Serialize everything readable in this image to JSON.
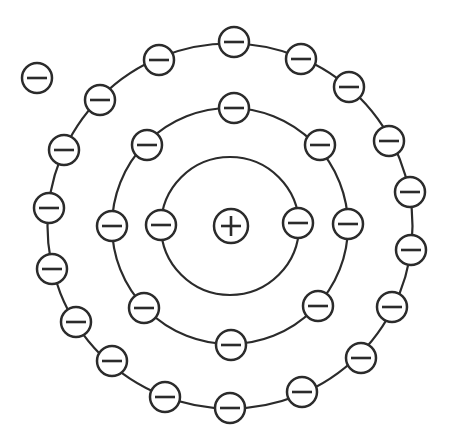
{
  "canvas": {
    "width": 449,
    "height": 436,
    "background": "#ffffff"
  },
  "style": {
    "stroke_color": "#2b2b2b",
    "particle_fill": "#ffffff",
    "orbit_stroke_width": 2.2,
    "particle_stroke_width": 2.5,
    "symbol_stroke_width": 2.6,
    "electron_radius": 15,
    "nucleus_radius": 17,
    "symbol_arm": 10
  },
  "center": {
    "x": 230,
    "y": 226
  },
  "nucleus": {
    "x": 231,
    "y": 226,
    "symbol": "+"
  },
  "electron_symbol": "−",
  "shells": [
    {
      "index": 1,
      "orbit_radius": 69,
      "electron_count": 2,
      "electrons": [
        [
          161,
          225
        ],
        [
          298,
          223
        ]
      ]
    },
    {
      "index": 2,
      "orbit_radius": 118,
      "electron_count": 8,
      "electrons": [
        [
          234,
          108
        ],
        [
          320,
          145
        ],
        [
          348,
          224
        ],
        [
          318,
          306
        ],
        [
          231,
          345
        ],
        [
          144,
          308
        ],
        [
          112,
          226
        ],
        [
          147,
          145
        ]
      ]
    },
    {
      "index": 3,
      "orbit_radius": 182.5,
      "electron_count": 18,
      "electrons": [
        [
          234,
          42
        ],
        [
          301,
          59
        ],
        [
          349,
          87
        ],
        [
          389,
          141
        ],
        [
          410,
          192
        ],
        [
          411,
          250
        ],
        [
          392,
          307
        ],
        [
          361,
          358
        ],
        [
          302,
          392
        ],
        [
          230,
          408
        ],
        [
          165,
          397
        ],
        [
          112,
          361
        ],
        [
          76,
          322
        ],
        [
          52,
          269
        ],
        [
          49,
          208
        ],
        [
          64,
          150
        ],
        [
          100,
          100
        ],
        [
          159,
          60
        ]
      ]
    }
  ],
  "free_electron": {
    "x": 37,
    "y": 78,
    "symbol": "−"
  },
  "totals": {
    "shell_electrons": 28,
    "free_electrons": 1
  }
}
